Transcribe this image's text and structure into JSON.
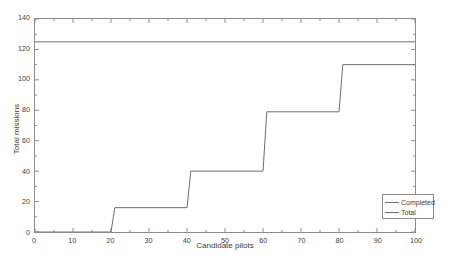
{
  "chart_data": {
    "type": "line",
    "title": "",
    "xlabel": "Candidate pilots",
    "ylabel": "Total missions",
    "xlim": [
      0,
      100
    ],
    "ylim": [
      0,
      140
    ],
    "xticks": [
      0,
      10,
      20,
      30,
      40,
      50,
      60,
      70,
      80,
      90,
      100
    ],
    "yticks": [
      0,
      20,
      40,
      60,
      80,
      100,
      120,
      140
    ],
    "grid": false,
    "legend": {
      "position": "lower-right",
      "entries": [
        "Completed",
        "Total"
      ]
    },
    "series": [
      {
        "name": "Completed",
        "style": "step",
        "color": "#6e6e6e",
        "x": [
          0,
          20,
          21,
          40,
          41,
          60,
          61,
          80,
          81,
          100
        ],
        "y": [
          0,
          0,
          16,
          16,
          40,
          40,
          79,
          79,
          110,
          110
        ]
      },
      {
        "name": "Total",
        "style": "constant",
        "color": "#6e6e6e",
        "x": [
          0,
          100
        ],
        "y": [
          125,
          125
        ]
      }
    ],
    "annotations": []
  },
  "axis": {
    "x_tick_labels": [
      "0",
      "10",
      "20",
      "30",
      "40",
      "50",
      "60",
      "70",
      "80",
      "90",
      "100"
    ],
    "y_tick_labels": [
      "0",
      "20",
      "40",
      "60",
      "80",
      "100",
      "120",
      "140"
    ]
  },
  "legend": {
    "completed_label": "Completed",
    "total_label": "Total"
  },
  "colors": {
    "line": "#6e6e6e",
    "axis": "#8c8c8c",
    "text": "#3d3d3d",
    "background": "#ffffff"
  }
}
